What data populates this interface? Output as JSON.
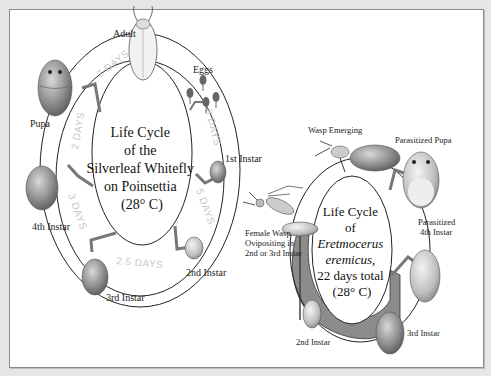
{
  "whitefly": {
    "title_lines": [
      "Life Cycle",
      "of the",
      "Silverleaf Whitefly",
      "on Poinsettia",
      "(28° C)"
    ],
    "stages": {
      "adult": "Adult",
      "eggs": "Eggs",
      "first_instar": "1st Instar",
      "second_instar": "2nd Instar",
      "third_instar": "3rd Instar",
      "fourth_instar": "4th Instar",
      "pupa": "Pupa"
    },
    "durations": {
      "eggs_to_first": "8 DAYS",
      "first_to_second": "5 DAYS",
      "second_to_third": "2.5 DAYS",
      "third_to_fourth": "3 DAYS",
      "fourth_to_pupa": "2 DAYS",
      "pupa_to_adult": "2 DAYS"
    }
  },
  "wasp": {
    "title_lines": [
      "Life Cycle",
      "of",
      "Eretmocerus",
      "eremicus,",
      "22 days total",
      "(28° C)"
    ],
    "stages": {
      "emerging": "Wasp Emerging",
      "parasitized_pupa": "Parasitized Pupa",
      "parasitized_fourth_line1": "Parasitized",
      "parasitized_fourth_line2": "4th Instar",
      "third_instar": "3rd Instar",
      "second_instar": "2nd Instar",
      "female_line1": "Female Wasp",
      "female_line2": "Ovipositing in",
      "female_line3": "2nd or 3rd Instar"
    }
  }
}
